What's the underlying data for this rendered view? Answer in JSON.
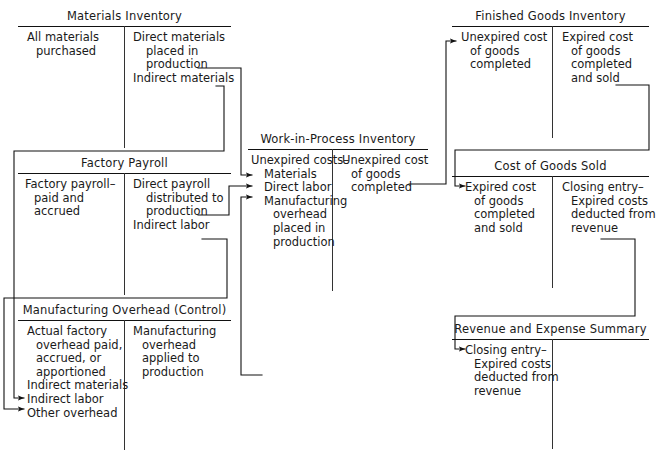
{
  "diagram": {
    "type": "t-account-flowchart",
    "line_color": "#111111",
    "background": "#ffffff"
  },
  "accounts": [
    {
      "id": "materials-inventory",
      "title": "Materials Inventory",
      "debit": [
        "All materials",
        "purchased"
      ],
      "credit": [
        "Direct materials",
        "placed in",
        "production",
        "Indirect materials"
      ]
    },
    {
      "id": "factory-payroll",
      "title": "Factory Payroll",
      "debit": [
        "Factory payroll–",
        "paid and",
        "accrued"
      ],
      "credit": [
        "Direct payroll",
        "distributed to",
        "production",
        "Indirect labor"
      ]
    },
    {
      "id": "manufacturing-overhead",
      "title": "Manufacturing Overhead (Control)",
      "debit": [
        "Actual factory",
        "overhead paid,",
        "accrued, or",
        "apportioned",
        "Indirect materials",
        "Indirect labor",
        "Other overhead"
      ],
      "credit": [
        "Manufacturing",
        "overhead",
        "applied to",
        "production"
      ]
    },
    {
      "id": "work-in-process-inventory",
      "title": "Work-in-Process Inventory",
      "debit": [
        "Unexpired costs–",
        "Materials",
        "Direct labor",
        "Manufacturing",
        "overhead",
        "placed in",
        "production"
      ],
      "credit": [
        "Unexpired cost",
        "of goods",
        "completed"
      ]
    },
    {
      "id": "finished-goods-inventory",
      "title": "Finished Goods Inventory",
      "debit": [
        "Unexpired cost",
        "of goods",
        "completed"
      ],
      "credit": [
        "Expired cost",
        "of goods",
        "completed",
        "and sold"
      ]
    },
    {
      "id": "cost-of-goods-sold",
      "title": "Cost of Goods Sold",
      "debit": [
        "Expired cost",
        "of goods",
        "completed",
        "and sold"
      ],
      "credit": [
        "Closing entry–",
        "Expired costs",
        "deducted from",
        "revenue"
      ]
    },
    {
      "id": "revenue-and-expense-summary",
      "title": "Revenue and Expense Summary",
      "debit": [
        "Closing entry–",
        "Expired costs",
        "deducted from",
        "revenue"
      ],
      "credit": []
    }
  ],
  "flows": [
    {
      "id": "direct-materials-to-wip",
      "from": "materials-inventory",
      "to": "work-in-process-inventory",
      "label": "Direct materials placed in production"
    },
    {
      "id": "indirect-materials-to-moh",
      "from": "materials-inventory",
      "to": "manufacturing-overhead",
      "label": "Indirect materials"
    },
    {
      "id": "direct-payroll-to-wip",
      "from": "factory-payroll",
      "to": "work-in-process-inventory",
      "label": "Direct payroll distributed to production"
    },
    {
      "id": "indirect-labor-to-moh",
      "from": "factory-payroll",
      "to": "manufacturing-overhead",
      "label": "Indirect labor"
    },
    {
      "id": "moh-applied-to-wip",
      "from": "manufacturing-overhead",
      "to": "work-in-process-inventory",
      "label": "Manufacturing overhead applied to production"
    },
    {
      "id": "wip-to-finished-goods",
      "from": "work-in-process-inventory",
      "to": "finished-goods-inventory",
      "label": "Unexpired cost of goods completed"
    },
    {
      "id": "finished-goods-to-cogs",
      "from": "finished-goods-inventory",
      "to": "cost-of-goods-sold",
      "label": "Expired cost of goods completed and sold"
    },
    {
      "id": "cogs-to-revenue-summary",
      "from": "cost-of-goods-sold",
      "to": "revenue-and-expense-summary",
      "label": "Closing entry–Expired costs deducted from revenue"
    }
  ]
}
